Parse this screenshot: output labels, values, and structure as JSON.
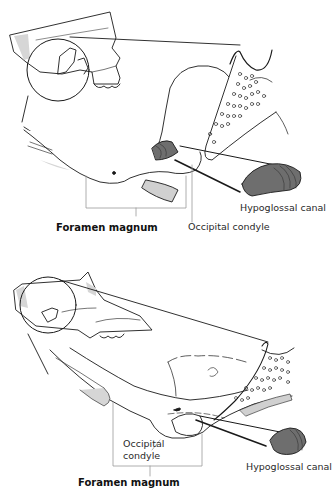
{
  "figure": {
    "panels": [
      {
        "id": "top",
        "labels": {
          "hypoglossal_canal": "Hypoglossal canal",
          "occipital_condyle": "Occipital condyle",
          "foramen_magnum": "Foramen magnum"
        }
      },
      {
        "id": "bottom",
        "labels": {
          "occipital_condyle_line1": "Occipital",
          "occipital_condyle_line2": "condyle",
          "hypoglossal_canal": "Hypoglossal canal",
          "foramen_magnum": "Foramen magnum"
        }
      }
    ],
    "colors": {
      "line": "#1a1a1a",
      "shade": "#d0d0d0",
      "canal_fill": "#6e6e6e",
      "leader": "#9a9a9a",
      "background": "#ffffff"
    }
  }
}
